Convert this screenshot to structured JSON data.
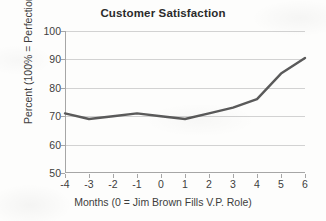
{
  "chart_data": {
    "type": "line",
    "title": "Customer Satisfaction",
    "xlabel": "Months (0 = Jim Brown Fills V.P. Role)",
    "ylabel": "Percent (100% = Perfection)",
    "x": [
      -4,
      -3,
      -2,
      -1,
      0,
      1,
      2,
      3,
      4,
      5,
      6
    ],
    "xticklabels": [
      "-4",
      "-3",
      "-2",
      "-1",
      "0",
      "1",
      "2",
      "3",
      "4",
      "5",
      "6"
    ],
    "values": [
      71,
      69,
      70,
      71,
      70,
      69,
      71,
      73,
      76,
      85,
      90.5
    ],
    "yticks": [
      50,
      60,
      70,
      80,
      90,
      100
    ],
    "yticklabels": [
      "50",
      "60",
      "70",
      "80",
      "90",
      "100"
    ],
    "ylim": [
      50,
      100
    ],
    "xlim": [
      -4,
      6
    ],
    "grid": "horizontal",
    "legend": "none",
    "series": [
      {
        "name": "Customer Satisfaction",
        "color": "#5a5a5a",
        "values": [
          71,
          69,
          70,
          71,
          70,
          69,
          71,
          73,
          76,
          85,
          90.5
        ]
      }
    ]
  }
}
